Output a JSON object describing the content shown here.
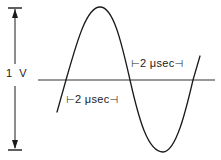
{
  "figure": {
    "amplitude_label": "1 V",
    "time_labels": {
      "upper": {
        "left_bracket": "⊢",
        "text": "2 μsec",
        "right_bracket": "⊣"
      },
      "lower": {
        "left_bracket": "⊢",
        "text": "2 μsec",
        "right_bracket": "⊣"
      }
    },
    "colors": {
      "line": "#1a1a1a",
      "baseline": "#333333",
      "background": "#ffffff"
    }
  }
}
